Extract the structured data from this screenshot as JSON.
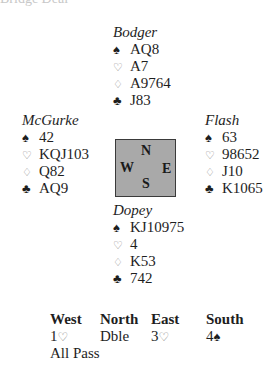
{
  "header": {
    "text": "Bridge Deal"
  },
  "suits": {
    "spade": "♠",
    "heart": "♡",
    "diamond": "♢",
    "club": "♣"
  },
  "hands": {
    "north": {
      "name": "Bodger",
      "spades": "AQ8",
      "hearts": "A7",
      "diamonds": "A9764",
      "clubs": "J83"
    },
    "west": {
      "name": "McGurke",
      "spades": "42",
      "hearts": "KQJ103",
      "diamonds": "Q82",
      "clubs": "AQ9"
    },
    "east": {
      "name": "Flash",
      "spades": "63",
      "hearts": "98652",
      "diamonds": "J10",
      "clubs": "K1065"
    },
    "south": {
      "name": "Dopey",
      "spades": "KJ10975",
      "hearts": "4",
      "diamonds": "K53",
      "clubs": "742"
    }
  },
  "compass": {
    "n": "N",
    "s": "S",
    "w": "W",
    "e": "E",
    "fill": "#a9a9a9"
  },
  "auction": {
    "headers": [
      "West",
      "North",
      "East",
      "South"
    ],
    "bids": [
      {
        "level": "1",
        "suit": "♡"
      },
      {
        "level": "Dble",
        "suit": ""
      },
      {
        "level": "3",
        "suit": "♡"
      },
      {
        "level": "4",
        "suit": "♠"
      }
    ],
    "final": "All Pass"
  }
}
